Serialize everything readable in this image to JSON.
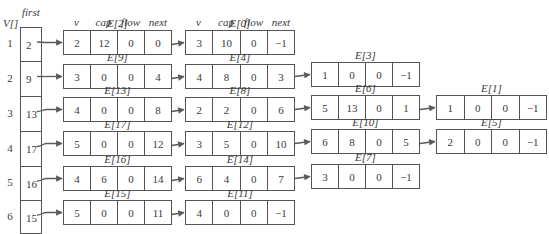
{
  "header": {
    "v_label": "V[]",
    "first_label": "first"
  },
  "field_headers": [
    "v",
    "cap",
    "flow",
    "next"
  ],
  "vertices": [
    {
      "index": "1",
      "first": "2"
    },
    {
      "index": "2",
      "first": "9"
    },
    {
      "index": "3",
      "first": "13"
    },
    {
      "index": "4",
      "first": "17"
    },
    {
      "index": "5",
      "first": "16"
    },
    {
      "index": "6",
      "first": "15"
    }
  ],
  "chains": [
    [
      {
        "label": "E[2]",
        "v": "2",
        "cap": "12",
        "flow": "0",
        "next": "0"
      },
      {
        "label": "E[0]",
        "v": "3",
        "cap": "10",
        "flow": "0",
        "next": "−1"
      }
    ],
    [
      {
        "label": "E[9]",
        "v": "3",
        "cap": "0",
        "flow": "0",
        "next": "4"
      },
      {
        "label": "E[4]",
        "v": "4",
        "cap": "8",
        "flow": "0",
        "next": "3"
      },
      {
        "label": "E[3]",
        "v": "1",
        "cap": "0",
        "flow": "0",
        "next": "−1"
      }
    ],
    [
      {
        "label": "E[13]",
        "v": "4",
        "cap": "0",
        "flow": "0",
        "next": "8"
      },
      {
        "label": "E[8]",
        "v": "2",
        "cap": "2",
        "flow": "0",
        "next": "6"
      },
      {
        "label": "E[6]",
        "v": "5",
        "cap": "13",
        "flow": "0",
        "next": "1"
      },
      {
        "label": "E[1]",
        "v": "1",
        "cap": "0",
        "flow": "0",
        "next": "−1"
      }
    ],
    [
      {
        "label": "E[17]",
        "v": "5",
        "cap": "0",
        "flow": "0",
        "next": "12"
      },
      {
        "label": "E[12]",
        "v": "3",
        "cap": "5",
        "flow": "0",
        "next": "10"
      },
      {
        "label": "E[10]",
        "v": "6",
        "cap": "8",
        "flow": "0",
        "next": "5"
      },
      {
        "label": "E[5]",
        "v": "2",
        "cap": "0",
        "flow": "0",
        "next": "−1"
      }
    ],
    [
      {
        "label": "E[16]",
        "v": "4",
        "cap": "6",
        "flow": "0",
        "next": "14"
      },
      {
        "label": "E[14]",
        "v": "6",
        "cap": "4",
        "flow": "0",
        "next": "7"
      },
      {
        "label": "E[7]",
        "v": "3",
        "cap": "0",
        "flow": "0",
        "next": "−1"
      }
    ],
    [
      {
        "label": "E[15]",
        "v": "5",
        "cap": "0",
        "flow": "0",
        "next": "11"
      },
      {
        "label": "E[11]",
        "v": "4",
        "cap": "0",
        "flow": "0",
        "next": "−1"
      }
    ]
  ],
  "colors": {
    "line": "#555555",
    "arrow": "#5a5a5a",
    "text": "#3a3a3a"
  }
}
